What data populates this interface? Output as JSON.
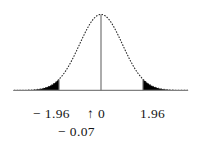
{
  "figure": {
    "background_color": "#ffffff",
    "ink_color": "#141414",
    "fill_color": "#000000",
    "axis_color": "#808080",
    "curve_style": "dotted"
  },
  "labels": {
    "left": "− 1.96",
    "center": "↑ 0",
    "right": "1.96",
    "below": "− 0.07"
  },
  "chart_data": {
    "type": "area",
    "title": "",
    "subtitle": "",
    "xlabel": "",
    "ylabel": "",
    "grid": false,
    "legend": null,
    "distribution": "standard normal",
    "mean": 0,
    "sd": 1,
    "xlim": [
      -4.06,
      4.06
    ],
    "ylim": [
      0,
      0.4
    ],
    "x_tick_values": [
      -1.96,
      0,
      1.96
    ],
    "x_tick_labels": [
      "− 1.96",
      "0",
      "1.96"
    ],
    "annotations": [
      {
        "label": "− 0.07",
        "x": -0.07,
        "type": "pointer",
        "marker": "↑"
      }
    ],
    "vertical_lines": [
      {
        "x": -1.96,
        "style": "solid",
        "from_y": 0,
        "to_y": 0.05844
      },
      {
        "x": 0,
        "style": "solid",
        "from_y": 0,
        "to_y": 0.39894
      },
      {
        "x": 1.96,
        "style": "solid",
        "from_y": 0,
        "to_y": 0.05844
      }
    ],
    "shaded_regions": [
      {
        "name": "left-tail",
        "from_x": -4.06,
        "to_x": -1.96,
        "area": 0.025,
        "color": "#000000"
      },
      {
        "name": "right-tail",
        "from_x": 1.96,
        "to_x": 4.06,
        "area": 0.025,
        "color": "#000000"
      }
    ],
    "curve_points": {
      "x": [
        -4.06,
        -3.8,
        -3.6,
        -3.4,
        -3.2,
        -3.0,
        -2.8,
        -2.6,
        -2.4,
        -2.2,
        -2.0,
        -1.96,
        -1.8,
        -1.6,
        -1.4,
        -1.2,
        -1.0,
        -0.8,
        -0.6,
        -0.4,
        -0.2,
        0.0,
        0.2,
        0.4,
        0.6,
        0.8,
        1.0,
        1.2,
        1.4,
        1.6,
        1.8,
        1.96,
        2.0,
        2.2,
        2.4,
        2.6,
        2.8,
        3.0,
        3.2,
        3.4,
        3.6,
        3.8,
        4.06
      ],
      "y": [
        0.0001,
        0.0003,
        0.0006,
        0.0012,
        0.0024,
        0.0044,
        0.0079,
        0.0136,
        0.0224,
        0.0355,
        0.054,
        0.0584,
        0.079,
        0.1109,
        0.1497,
        0.1942,
        0.242,
        0.2897,
        0.3332,
        0.3683,
        0.391,
        0.3989,
        0.391,
        0.3683,
        0.3332,
        0.2897,
        0.242,
        0.1942,
        0.1497,
        0.1109,
        0.079,
        0.0584,
        0.054,
        0.0355,
        0.0224,
        0.0136,
        0.0079,
        0.0044,
        0.0024,
        0.0012,
        0.0006,
        0.0003,
        0.0001
      ]
    }
  }
}
